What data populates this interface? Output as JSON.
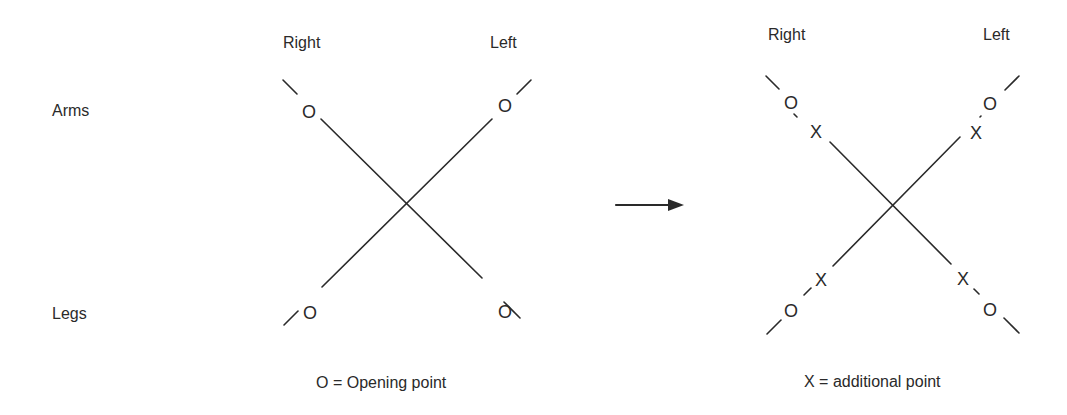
{
  "row_labels": {
    "arms": "Arms",
    "legs": "Legs"
  },
  "left_panel": {
    "col_right": "Right",
    "col_left": "Left",
    "legend": "O = Opening point",
    "markers": {
      "ul": "O",
      "ur": "O",
      "ll": "O",
      "lr": "O"
    }
  },
  "right_panel": {
    "col_right": "Right",
    "col_left": "Left",
    "legend": "X = additional point",
    "markers": {
      "ul_o": "O",
      "ul_x": "X",
      "ur_o": "O",
      "ur_x": "X",
      "ll_o": "O",
      "ll_x": "X",
      "lr_o": "O",
      "lr_x": "X"
    }
  },
  "colors": {
    "ink": "#2a2a2a",
    "background": "#ffffff"
  }
}
